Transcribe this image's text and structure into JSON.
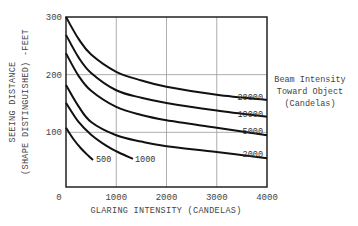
{
  "chart_data": {
    "type": "line",
    "title": "",
    "xlabel": "GLARING INTENSITY (CANDELAS)",
    "ylabel_line1": "SEEING DISTANCE",
    "ylabel_line2": "(SHAPE DISTINGUISHED) -FEET",
    "xlim": [
      0,
      4000
    ],
    "ylim": [
      0,
      300
    ],
    "x_ticks": [
      0,
      1000,
      2000,
      3000,
      4000
    ],
    "y_ticks": [
      100,
      200,
      300
    ],
    "grid": true,
    "legend_title": [
      "Beam Intensity",
      "Toward Object",
      "(Candelas)"
    ],
    "legend_position": "right",
    "series": [
      {
        "name": "20000",
        "x": [
          0,
          250,
          500,
          1000,
          1500,
          2000,
          3000,
          4000
        ],
        "y": [
          300,
          262,
          235,
          205,
          190,
          179,
          165,
          156
        ]
      },
      {
        "name": "10000",
        "x": [
          0,
          250,
          500,
          1000,
          1500,
          2000,
          3000,
          4000
        ],
        "y": [
          269,
          230,
          203,
          173,
          160,
          151,
          138,
          127
        ]
      },
      {
        "name": "5000",
        "x": [
          0,
          250,
          500,
          1000,
          1500,
          2000,
          3000,
          4000
        ],
        "y": [
          237,
          198,
          172,
          144,
          130,
          121,
          108,
          95
        ]
      },
      {
        "name": "2000",
        "x": [
          0,
          250,
          500,
          1000,
          1500,
          2000,
          3000,
          4000
        ],
        "y": [
          182,
          145,
          118,
          95,
          84,
          76,
          66,
          55
        ]
      },
      {
        "name": "1000",
        "x": [
          0,
          250,
          500,
          800,
          1050,
          1333
        ],
        "y": [
          151,
          118,
          96,
          77,
          65,
          54
        ]
      },
      {
        "name": "500",
        "x": [
          0,
          150,
          300,
          450,
          537
        ],
        "y": [
          108,
          88,
          72,
          59,
          52
        ]
      }
    ]
  }
}
